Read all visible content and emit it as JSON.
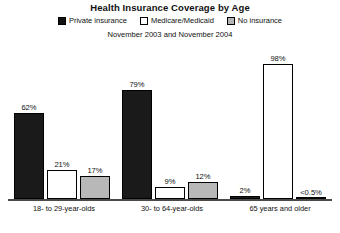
{
  "chart_data": {
    "type": "bar",
    "title": "Health Insurance Coverage by Age",
    "subtitle": "November 2003 and November 2004",
    "xlabel": "",
    "ylabel": "",
    "ylim": [
      0,
      100
    ],
    "grid": false,
    "legend_position": "top",
    "categories": [
      "18- to 29-year-olds",
      "30- to 64-year-olds",
      "65 years and older"
    ],
    "series": [
      {
        "name": "Private insurance",
        "color": "#1a1a1a",
        "values": [
          62,
          79,
          2
        ],
        "labels": [
          "62%",
          "79%",
          "2%"
        ]
      },
      {
        "name": "Medicare/Medicaid",
        "color": "#ffffff",
        "values": [
          21,
          9,
          98
        ],
        "labels": [
          "21%",
          "9%",
          "98%"
        ]
      },
      {
        "name": "No insurance",
        "color": "#b8b8b8",
        "values": [
          17,
          12,
          0.4
        ],
        "labels": [
          "17%",
          "12%",
          "<0.5%"
        ]
      }
    ]
  },
  "legend": {
    "items": [
      {
        "label": "Private insurance"
      },
      {
        "label": "Medicare/Medicaid"
      },
      {
        "label": "No insurance"
      }
    ]
  }
}
